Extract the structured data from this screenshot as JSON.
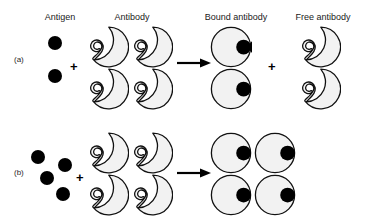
{
  "figure": {
    "background_color": "#ffffff",
    "outline_color": "#111111",
    "antibody_fill": "#f2f2f2",
    "antigen_color": "#000000"
  },
  "column_labels": {
    "antigen": "Antigen",
    "antibody": "Antibody",
    "bound_antibody": "Bound antibody",
    "free_antibody": "Free antibody"
  },
  "operators": {
    "plus": "+",
    "arrow": "arrow-right-icon"
  },
  "rows": [
    {
      "id": "a",
      "label": "(a)",
      "antigen_count": 2,
      "antibody_count": 4,
      "bound_antibody_count": 2,
      "free_antibody_count": 2,
      "has_free_antibody": true
    },
    {
      "id": "b",
      "label": "(b)",
      "antigen_count": 4,
      "antibody_count": 4,
      "bound_antibody_count": 4,
      "free_antibody_count": 0,
      "has_free_antibody": false
    }
  ]
}
